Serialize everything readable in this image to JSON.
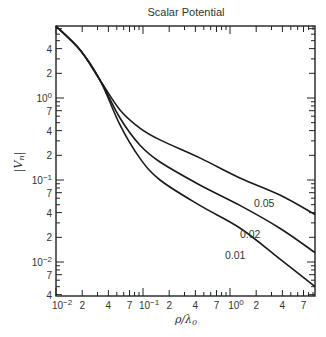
{
  "chart_data": {
    "type": "line",
    "title": "Scalar Potential",
    "xlabel": "ρ/λ0",
    "ylabel": "|Vn|",
    "xscale": "log",
    "yscale": "log",
    "xlim": [
      0.01,
      9.5
    ],
    "ylim": [
      0.004,
      7.5
    ],
    "grid": false,
    "legend": "inline curve labels",
    "x_tick_labels": [
      "10^-2",
      "2",
      "4",
      "7",
      "10^-1",
      "2",
      "4",
      "7",
      "10^0",
      "2",
      "4",
      "7"
    ],
    "y_tick_labels": [
      "4",
      "2",
      "10^0",
      "7",
      "4",
      "2",
      "10^-1",
      "7",
      "4",
      "2",
      "10^-2",
      "7",
      "4"
    ],
    "series": [
      {
        "name": "0.05",
        "x": [
          0.01,
          0.0189,
          0.032,
          0.0544,
          0.092,
          0.157,
          0.45,
          1.3,
          3.7,
          9.5
        ],
        "y": [
          7.5,
          3.85,
          1.66,
          0.714,
          0.43,
          0.308,
          0.186,
          0.106,
          0.066,
          0.038
        ]
      },
      {
        "name": "0.02",
        "x": [
          0.01,
          0.0189,
          0.032,
          0.0544,
          0.092,
          0.157,
          0.45,
          1.3,
          3.7,
          9.5
        ],
        "y": [
          7.5,
          3.85,
          1.66,
          0.57,
          0.267,
          0.166,
          0.087,
          0.049,
          0.026,
          0.013
        ]
      },
      {
        "name": "0.01",
        "x": [
          0.01,
          0.0189,
          0.032,
          0.0544,
          0.092,
          0.157,
          0.45,
          1.3,
          3.7,
          9.5
        ],
        "y": [
          7.5,
          3.85,
          1.66,
          0.47,
          0.185,
          0.1,
          0.049,
          0.026,
          0.011,
          0.005
        ]
      }
    ],
    "annotations": [
      "0.05",
      "0.02",
      "0.01"
    ]
  },
  "labels": {
    "title": "Scalar Potential",
    "xlabel": "ρ/λ",
    "xlabel_sub": "0",
    "ylabel": "|V",
    "ylabel_sub": "n",
    "ylabel_end": "|"
  }
}
